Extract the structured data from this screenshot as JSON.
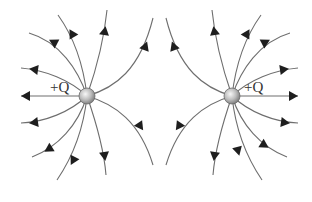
{
  "diagram": {
    "charges": [
      {
        "id": "left",
        "label": "+Q",
        "cx": 87,
        "cy": 96,
        "r": 8
      },
      {
        "id": "right",
        "label": "+Q",
        "cx": 232,
        "cy": 96,
        "r": 8
      }
    ],
    "colors": {
      "line": "#6e6e6e",
      "arrow": "#1e1e1e",
      "charge_fill_light": "#f2f2f2",
      "charge_fill_dark": "#8a8a8a"
    },
    "field_line_direction": "outward from each positive charge"
  }
}
